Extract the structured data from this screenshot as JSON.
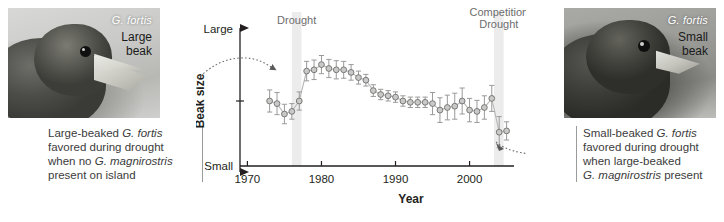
{
  "photos": {
    "left": {
      "species": "G. fortis",
      "caption_line1": "Large",
      "caption_line2": "beak"
    },
    "right": {
      "species": "G. fortis",
      "caption_line1": "Small",
      "caption_line2": "beak"
    }
  },
  "notes": {
    "left": {
      "line1_pre": "Large-beaked ",
      "line1_sp": "G. fortis",
      "line2": "favored during drought",
      "line3_pre": "when no ",
      "line3_sp": "G. magnirostris",
      "line4": "present on island"
    },
    "right": {
      "line1_pre": "Small-beaked ",
      "line1_sp": "G. fortis",
      "line2": "favored during drought",
      "line3": "when large-beaked",
      "line4_sp": "G. magnirostris",
      "line4_post": " present"
    }
  },
  "chart_data": {
    "type": "scatter",
    "title": "",
    "xlabel": "Year",
    "ylabel": "Beak size",
    "y_top_label": "Large",
    "y_bottom_label": "Small",
    "xlim": [
      1969,
      2006
    ],
    "ylim": [
      0,
      1
    ],
    "grid": false,
    "legend": false,
    "xticks": [
      1970,
      1980,
      1990,
      2000
    ],
    "xtick_labels": [
      "1970",
      "1980",
      "1990",
      "2000"
    ],
    "annotations": [
      {
        "name": "drought-band-1",
        "label": "Drought",
        "x_start": 1976.0,
        "x_end": 1977.3
      },
      {
        "name": "drought-band-2",
        "label_line1": "Competition",
        "label_line2": "Drought",
        "x_start": 2003.3,
        "x_end": 2004.6
      }
    ],
    "series": [
      {
        "name": "Beak size (mean ± error)",
        "marker": "circle",
        "error_bars": true,
        "x": [
          1973,
          1974,
          1975,
          1976,
          1977,
          1978,
          1979,
          1980,
          1981,
          1982,
          1983,
          1984,
          1985,
          1986,
          1987,
          1988,
          1989,
          1990,
          1991,
          1992,
          1993,
          1994,
          1995,
          1996,
          1997,
          1998,
          1999,
          2000,
          2001,
          2002,
          2003,
          2004,
          2005
        ],
        "y": [
          0.5,
          0.48,
          0.4,
          0.42,
          0.5,
          0.73,
          0.74,
          0.78,
          0.75,
          0.74,
          0.74,
          0.72,
          0.68,
          0.66,
          0.58,
          0.55,
          0.54,
          0.53,
          0.5,
          0.49,
          0.49,
          0.49,
          0.48,
          0.43,
          0.45,
          0.46,
          0.5,
          0.43,
          0.42,
          0.45,
          0.52,
          0.26,
          0.27
        ],
        "yerr": [
          0.085,
          0.085,
          0.075,
          0.06,
          0.07,
          0.075,
          0.075,
          0.07,
          0.07,
          0.07,
          0.065,
          0.06,
          0.05,
          0.045,
          0.045,
          0.04,
          0.04,
          0.04,
          0.04,
          0.04,
          0.04,
          0.04,
          0.085,
          0.095,
          0.095,
          0.1,
          0.1,
          0.09,
          0.085,
          0.09,
          0.1,
          0.12,
          0.07
        ]
      }
    ],
    "connector_arrows": [
      {
        "name": "arrow-from-left-photo",
        "points": "left caption to 1977 rise"
      },
      {
        "name": "arrow-to-right-photo",
        "points": "2005 low point to right caption"
      }
    ]
  }
}
